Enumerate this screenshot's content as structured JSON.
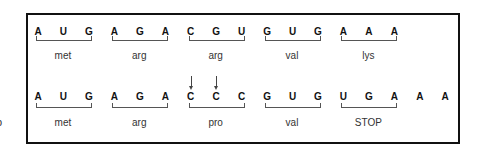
{
  "figure": {
    "side_label": "b",
    "original": {
      "bases": [
        "A",
        "U",
        "G",
        "A",
        "G",
        "A",
        "C",
        "G",
        "U",
        "G",
        "U",
        "G",
        "A",
        "A",
        "A"
      ],
      "codons": [
        {
          "bases": "AUG",
          "amino_acid": "met"
        },
        {
          "bases": "AGA",
          "amino_acid": "arg"
        },
        {
          "bases": "CGU",
          "amino_acid": "arg"
        },
        {
          "bases": "GUG",
          "amino_acid": "val"
        },
        {
          "bases": "AAA",
          "amino_acid": "lys"
        }
      ]
    },
    "mutated": {
      "bases": [
        "A",
        "U",
        "G",
        "A",
        "G",
        "A",
        "C",
        "C",
        "C",
        "G",
        "U",
        "G",
        "U",
        "G",
        "A",
        "A",
        "A"
      ],
      "codons": [
        {
          "bases": "AUG",
          "amino_acid": "met"
        },
        {
          "bases": "AGA",
          "amino_acid": "arg"
        },
        {
          "bases": "CCC",
          "amino_acid": "pro"
        },
        {
          "bases": "GUG",
          "amino_acid": "val"
        },
        {
          "bases": "UGA",
          "amino_acid": "STOP"
        }
      ],
      "trailing_bases": [
        "A",
        "A"
      ],
      "arrow_positions": [
        7,
        8
      ]
    }
  }
}
